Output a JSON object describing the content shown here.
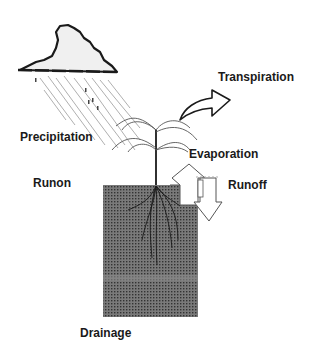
{
  "diagram": {
    "labels": {
      "precipitation": "Precipitation",
      "transpiration": "Transpiration",
      "evaporation": "Evaporation",
      "runon": "Runon",
      "runoff": "Runoff",
      "drainage": "Drainage"
    },
    "elements": [
      "cloud",
      "rain",
      "plant",
      "roots",
      "soil-profile",
      "transpiration-arrow",
      "evaporation-arrow",
      "runoff-arrow"
    ],
    "colors": {
      "soil": "#6e6e6e",
      "soil_dot": "#3a3a3a",
      "line": "#1a1a1a",
      "rain": "#9a9a9a"
    }
  }
}
